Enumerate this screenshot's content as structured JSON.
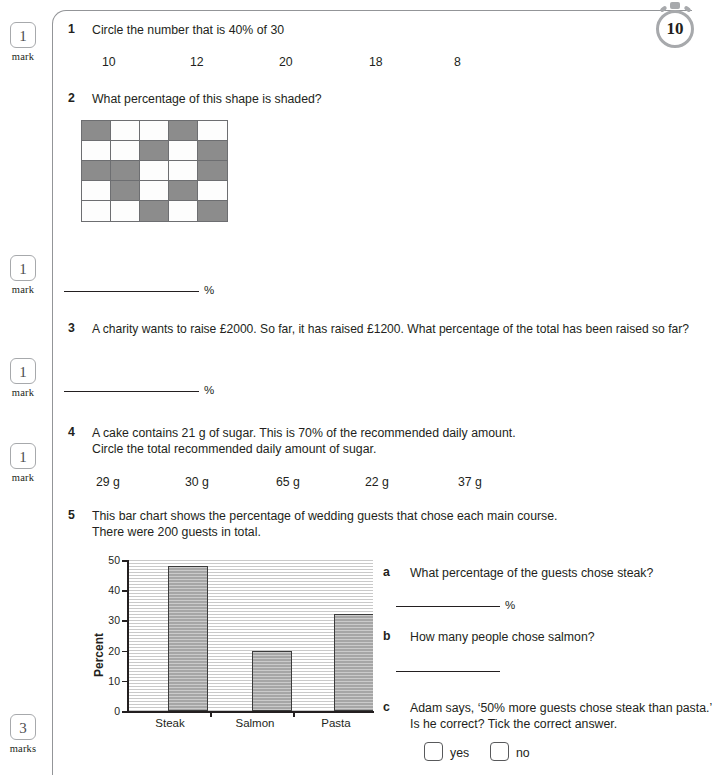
{
  "badge": {
    "value": "10",
    "icon": "stopwatch-icon"
  },
  "marks": [
    {
      "value": "1",
      "label": "mark",
      "top": 22
    },
    {
      "value": "1",
      "label": "mark",
      "top": 255
    },
    {
      "value": "1",
      "label": "mark",
      "top": 358
    },
    {
      "value": "1",
      "label": "mark",
      "top": 443
    },
    {
      "value": "3",
      "label": "marks",
      "top": 714
    }
  ],
  "questions": [
    {
      "number": "1",
      "text": "Circle the number that is 40% of 30",
      "options": [
        "10",
        "12",
        "20",
        "18",
        "8"
      ]
    },
    {
      "number": "2",
      "text": "What percentage of this shape is shaded?",
      "answer_unit": "%"
    },
    {
      "number": "3",
      "text": "A charity wants to raise £2000. So far, it has raised £1200. What percentage of the total has been raised so far?",
      "answer_unit": "%"
    },
    {
      "number": "4",
      "line1": "A cake contains 21 g of sugar. This is 70% of the recommended daily amount.",
      "line2": "Circle the total recommended daily amount of sugar.",
      "options": [
        "29 g",
        "30 g",
        "65 g",
        "22 g",
        "37 g"
      ]
    },
    {
      "number": "5",
      "line1": "This bar chart shows the percentage of wedding guests that chose each main course.",
      "line2": "There were 200 guests in total.",
      "subquestions": [
        {
          "letter": "a",
          "text": "What percentage of the guests chose steak?",
          "answer_unit": "%"
        },
        {
          "letter": "b",
          "text": "How many people chose salmon?"
        },
        {
          "letter": "c",
          "line1": "Adam says, ‘50% more guests chose steak than pasta.’",
          "line2": "Is he correct? Tick the correct answer.",
          "choices": [
            "yes",
            "no"
          ]
        }
      ]
    }
  ],
  "shape_grid": {
    "rows": 5,
    "columns": 5,
    "shaded_count": 12,
    "total_count": 25,
    "cells": [
      [
        1,
        0,
        0,
        1,
        0
      ],
      [
        0,
        0,
        1,
        0,
        1
      ],
      [
        1,
        1,
        0,
        0,
        1
      ],
      [
        0,
        1,
        0,
        1,
        0
      ],
      [
        0,
        0,
        1,
        0,
        1
      ]
    ],
    "shaded_color": "#8c8c8c",
    "unshaded_color": "#fdfdfd"
  },
  "chart_data": {
    "type": "bar",
    "title": "",
    "categories": [
      "Steak",
      "Salmon",
      "Pasta"
    ],
    "values": [
      48,
      20,
      32
    ],
    "xlabel": "",
    "ylabel": "Percent",
    "ylim": [
      0,
      50
    ],
    "yticks": [
      0,
      10,
      20,
      30,
      40,
      50
    ],
    "grid": true,
    "legend": false,
    "bar_color": "#a6a6a6"
  }
}
